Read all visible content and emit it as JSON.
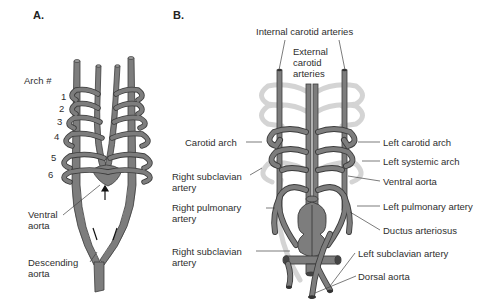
{
  "panels": {
    "a": {
      "label": "A.",
      "arch_heading": "Arch #",
      "arch_numbers": [
        "1",
        "2",
        "3",
        "4",
        "5",
        "6"
      ],
      "labels": {
        "ventral_aorta_1": "Ventral",
        "ventral_aorta_2": "aorta",
        "descending_aorta_1": "Descending",
        "descending_aorta_2": "aorta"
      }
    },
    "b": {
      "label": "B.",
      "labels": {
        "internal_carotid": "Internal carotid arteries",
        "external_carotid_1": "External",
        "external_carotid_2": "carotid",
        "external_carotid_3": "arteries",
        "carotid_arch": "Carotid arch",
        "right_subclavian_top_1": "Right subclavian",
        "right_subclavian_top_2": "artery",
        "right_pulmonary_1": "Right pulmonary",
        "right_pulmonary_2": "artery",
        "right_subclavian_bottom_1": "Right subclavian",
        "right_subclavian_bottom_2": "artery",
        "left_carotid_arch": "Left carotid arch",
        "left_systemic_arch": "Left systemic arch",
        "ventral_aorta": "Ventral aorta",
        "left_pulmonary_artery": "Left pulmonary artery",
        "ductus_arteriosus": "Ductus arteriosus",
        "left_subclavian_artery": "Left subclavian artery",
        "dorsal_aorta": "Dorsal aorta"
      }
    }
  },
  "colors": {
    "vessel": "#7d7d7d",
    "vessel_outline": "#3c3c3c",
    "faded_vessel": "#d9d9d9",
    "leader_line": "#444444",
    "text": "#2e2e2e"
  }
}
